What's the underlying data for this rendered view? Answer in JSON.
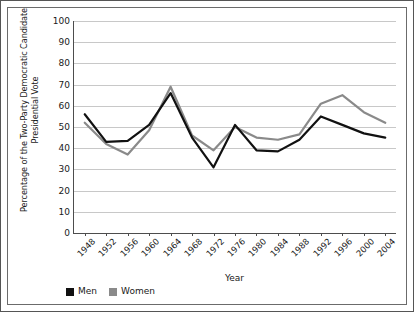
{
  "chart_data": {
    "type": "line",
    "title": "",
    "xlabel": "Year",
    "ylabel": "Percentage of the Two-Party Democratic Candidate Presidential Vote",
    "ylabel_line1": "Percentage of the Two-Party Democratic Candidate",
    "ylabel_line2": "Presidential Vote",
    "categories": [
      "1948",
      "1952",
      "1956",
      "1960",
      "1964",
      "1968",
      "1972",
      "1976",
      "1980",
      "1984",
      "1988",
      "1992",
      "1996",
      "2000",
      "2004"
    ],
    "x": [
      1948,
      1952,
      1956,
      1960,
      1964,
      1968,
      1972,
      1976,
      1980,
      1984,
      1988,
      1992,
      1996,
      2000,
      2004
    ],
    "series": [
      {
        "name": "Men",
        "color": "#111111",
        "values": [
          56,
          43,
          43.5,
          51,
          66,
          45,
          31,
          51,
          39,
          38.5,
          44,
          55,
          51,
          47,
          45
        ]
      },
      {
        "name": "Women",
        "color": "#8a8a8a",
        "values": [
          52,
          42,
          37,
          48.5,
          69,
          46,
          39,
          50,
          45,
          44,
          46.5,
          61,
          65,
          57,
          52
        ]
      }
    ],
    "ylim": [
      0,
      100
    ],
    "ytick_step": 10,
    "yticks": [
      0,
      10,
      20,
      30,
      40,
      50,
      60,
      70,
      80,
      90,
      100
    ],
    "grid": true,
    "grid_axis": "y",
    "legend_position": "bottom-left",
    "xtick_rotation": -45
  },
  "legend": {
    "entries": [
      {
        "label": "Men",
        "color": "#111111"
      },
      {
        "label": "Women",
        "color": "#8a8a8a"
      }
    ]
  }
}
